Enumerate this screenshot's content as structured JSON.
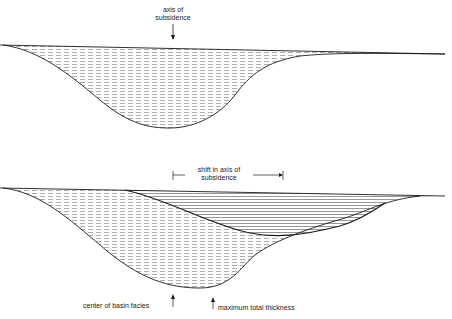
{
  "top_diagram": {
    "label_line1": "axis of",
    "label_line2": "subsidence"
  },
  "bottom_diagram": {
    "shift_label_line1": "shift in axis of",
    "shift_label_line2": "subsidence",
    "center_label": "center of basin facies",
    "max_label": "maximum total thickness"
  },
  "colors": {
    "line": "#1a1a1a",
    "hatch": "#8a8a8a",
    "background": "#ffffff"
  }
}
